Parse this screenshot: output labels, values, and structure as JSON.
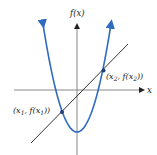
{
  "diagram": {
    "y_axis_label": "f(x)",
    "x_axis_label": "x",
    "points": [
      {
        "label": "(x1, f(x1))",
        "parts": [
          "(x",
          "1",
          ", f(x",
          "1",
          "))"
        ]
      },
      {
        "label": "(x2, f(x2))",
        "parts": [
          "(x",
          "2",
          ", f(x",
          "2",
          "))"
        ]
      }
    ],
    "colors": {
      "parabola": "#2f6bbf",
      "line": "#333333",
      "axes": "#888888",
      "point": "#1e3f7a"
    }
  }
}
